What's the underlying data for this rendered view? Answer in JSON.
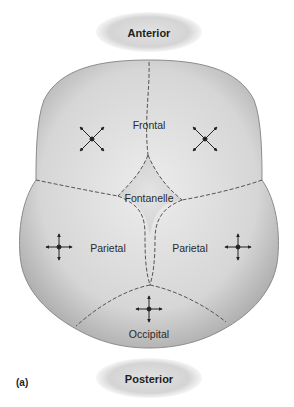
{
  "orientation": {
    "top": "Anterior",
    "bottom": "Posterior"
  },
  "figure_label": "(a)",
  "bones": {
    "frontal": "Frontal",
    "fontanelle": "Fontanelle",
    "parietal_left": "Parietal",
    "parietal_right": "Parietal",
    "occipital": "Occipital"
  },
  "growth_markers": [
    {
      "region": "frontal-left",
      "type": "diagonal-cross"
    },
    {
      "region": "frontal-right",
      "type": "diagonal-cross"
    },
    {
      "region": "parietal-left",
      "type": "orthogonal-cross"
    },
    {
      "region": "parietal-right",
      "type": "orthogonal-cross"
    },
    {
      "region": "occipital",
      "type": "orthogonal-cross"
    }
  ],
  "colors": {
    "bone_light": "#e6e6e6",
    "bone_mid": "#c8c8c8",
    "bone_dark": "#9a9a9a",
    "suture": "#555555",
    "ellipse": "#d8d8d8"
  }
}
